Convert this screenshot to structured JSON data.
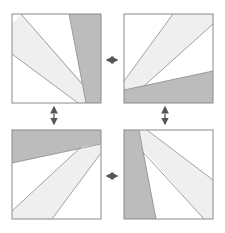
{
  "diagram": {
    "type": "four-panel rotation symmetry",
    "colors": {
      "background": "#ffffff",
      "panel_fill": "#ffffff",
      "light_band": "#efefef",
      "dark_band": "#bcbcbc",
      "stroke": "#8a8a8a",
      "arrow": "#555555"
    },
    "panels": [
      {
        "id": "top-left",
        "x": 12,
        "y": 14,
        "size": 89
      },
      {
        "id": "top-right",
        "x": 124,
        "y": 14,
        "size": 89
      },
      {
        "id": "bottom-left",
        "x": 12,
        "y": 130,
        "size": 89
      },
      {
        "id": "bottom-right",
        "x": 124,
        "y": 130,
        "size": 89
      }
    ],
    "arrows": [
      {
        "id": "top-horizontal",
        "from": "top-left",
        "to": "top-right",
        "direction": "bidirectional-horizontal"
      },
      {
        "id": "bottom-horizontal",
        "from": "bottom-left",
        "to": "bottom-right",
        "direction": "bidirectional-horizontal"
      },
      {
        "id": "left-vertical",
        "from": "top-left",
        "to": "bottom-left",
        "direction": "bidirectional-vertical"
      },
      {
        "id": "right-vertical",
        "from": "top-right",
        "to": "bottom-right",
        "direction": "bidirectional-vertical"
      }
    ]
  }
}
